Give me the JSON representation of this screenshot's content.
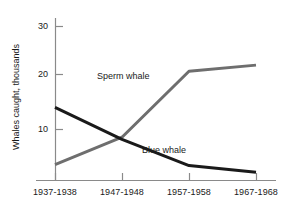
{
  "chart_data": {
    "type": "line",
    "title": "",
    "subtitle": "",
    "xlabel": "",
    "ylabel": "Whales caught, thousands",
    "categories": [
      "1937-1938",
      "1947-1948",
      "1957-1958",
      "1967-1968"
    ],
    "x_positions": [
      55,
      122,
      189,
      256
    ],
    "ylim": [
      0,
      32
    ],
    "y_ticks": [
      10,
      20,
      30
    ],
    "y_tick_labels": [
      "10",
      "20",
      "30"
    ],
    "grid": false,
    "legend_position": "inline-annotations",
    "series": [
      {
        "name": "Sperm whale",
        "values": [
          3.2,
          8.5,
          21.3,
          22.5
        ],
        "color": "#6e6e6e",
        "label_text": "Sperm whale"
      },
      {
        "name": "Blue whale",
        "values": [
          14.3,
          8.1,
          3.0,
          1.7
        ],
        "color": "#1a1a1a",
        "label_text": "Blue whale"
      }
    ],
    "annotations": [
      "Sperm whale",
      "Blue whale"
    ],
    "axis_color": "#808080"
  },
  "axes": {
    "y_tick_10": "10",
    "y_tick_20": "20",
    "y_tick_30": "30",
    "x_tick_0": "1937-1938",
    "x_tick_1": "1947-1948",
    "x_tick_2": "1957-1958",
    "x_tick_3": "1967-1968",
    "y_axis_title": "Whales caught, thousands"
  },
  "labels": {
    "sperm_whale": "Sperm whale",
    "blue_whale": "Blue whale"
  }
}
